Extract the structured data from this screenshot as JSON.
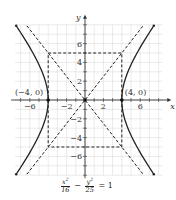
{
  "chart_data": {
    "type": "line",
    "title": "",
    "equation": "x^2/16 - y^2/25 = 1",
    "xlabel": "x",
    "ylabel": "y",
    "xlim": [
      -7.6,
      8.4
    ],
    "ylim": [
      -8,
      8
    ],
    "grid": true,
    "x_ticks": [
      -6,
      -2,
      2,
      6
    ],
    "y_ticks": [
      -6,
      -4,
      -2,
      2,
      4,
      6
    ],
    "series": [
      {
        "name": "hyperbola right branch",
        "style": "solid",
        "points": "x = 4*cosh(t), y = 5*sinh(t)"
      },
      {
        "name": "hyperbola left branch",
        "style": "solid",
        "points": "x = -4*cosh(t), y = 5*sinh(t)"
      },
      {
        "name": "asymptote y = 5x/4",
        "style": "dashed"
      },
      {
        "name": "asymptote y = -5x/4",
        "style": "dashed"
      },
      {
        "name": "fundamental rectangle",
        "style": "dashed",
        "corners": [
          [
            -4,
            5
          ],
          [
            4,
            5
          ],
          [
            4,
            -5
          ],
          [
            -4,
            -5
          ]
        ]
      }
    ],
    "annotations": [
      {
        "text": "(-4, 0)",
        "x": -4,
        "y": 0
      },
      {
        "text": "(4, 0)",
        "x": 4,
        "y": 0
      }
    ],
    "points": [
      [
        -4,
        0
      ],
      [
        4,
        0
      ],
      [
        0,
        0
      ]
    ]
  },
  "caption": {
    "num1": "x",
    "sup1": "2",
    "den1": "16",
    "minus": "−",
    "num2": "y",
    "sup2": "2",
    "den2": "25",
    "rhs": "= 1"
  },
  "labels": {
    "x_axis": "x",
    "y_axis": "y",
    "vertex_left": "(−4, 0)",
    "vertex_right": "(4, 0)"
  }
}
